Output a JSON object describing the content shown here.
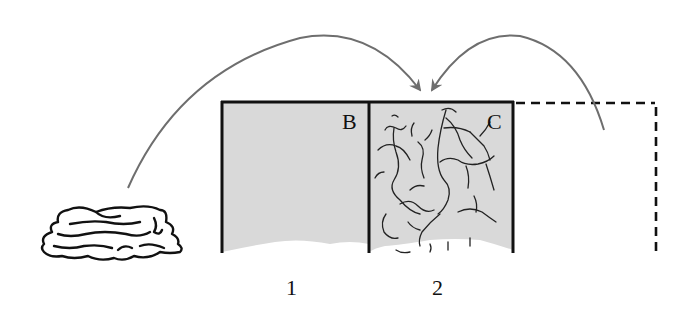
{
  "diagram": {
    "type": "schematic-illustration",
    "background": "#ffffff",
    "compartments": [
      {
        "id": "B",
        "letter": "B",
        "number": "1",
        "fill": "#d9d9d9",
        "contents": "empty"
      },
      {
        "id": "C",
        "letter": "C",
        "number": "2",
        "fill": "#d9d9d9",
        "contents": "tangled-fibers"
      },
      {
        "id": "dashed",
        "letter": "",
        "number": "",
        "style": "dashed-outline",
        "contents": "empty"
      }
    ],
    "arrows": [
      {
        "from": "heap-left",
        "to": "between-B-C",
        "color": "#6e6e6e"
      },
      {
        "from": "dashed-compartment",
        "to": "between-B-C",
        "color": "#6e6e6e"
      }
    ],
    "heap": {
      "description": "crumpled-mass"
    },
    "colors": {
      "outline": "#111111",
      "shade": "#d9d9d9",
      "arrow": "#6e6e6e",
      "fiber": "#222222"
    }
  }
}
